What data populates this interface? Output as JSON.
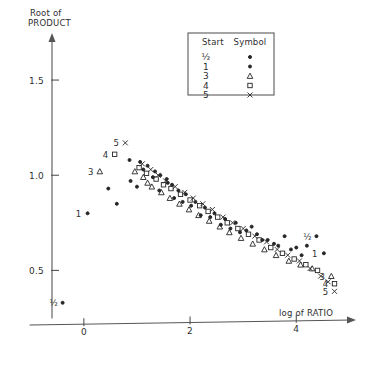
{
  "figure": {
    "title": "",
    "ylabel_line1": "Root of",
    "ylabel_line2": "PRODUCT",
    "xlabel": "log of RATIO"
  },
  "axes": {
    "x_ticks": [
      "0",
      "2",
      "4"
    ],
    "y_ticks": [
      "1.5",
      "1.0",
      "0.5"
    ],
    "x_tick_values": [
      0,
      2,
      4
    ],
    "y_tick_values": [
      1.5,
      1.0,
      0.5
    ]
  },
  "legend": {
    "header_left": "Start",
    "header_right": "Symbol",
    "rows": [
      {
        "label": "½",
        "symbol": "dot"
      },
      {
        "label": "1",
        "symbol": "dot"
      },
      {
        "label": "3",
        "symbol": "triangle"
      },
      {
        "label": "4",
        "symbol": "square"
      },
      {
        "label": "5",
        "symbol": "cross"
      }
    ]
  },
  "annotations": [
    {
      "text": "5",
      "x": 0.78,
      "y": 1.17,
      "symbol": "cross"
    },
    {
      "text": "4",
      "x": 0.58,
      "y": 1.11,
      "symbol": "square"
    },
    {
      "text": "3",
      "x": 0.3,
      "y": 1.02,
      "symbol": "triangle"
    },
    {
      "text": "1",
      "x": 0.07,
      "y": 0.8,
      "symbol": "dot"
    },
    {
      "text": "½",
      "x": -0.4,
      "y": 0.33,
      "symbol": "dot"
    },
    {
      "text": "½",
      "x": 4.38,
      "y": 0.68,
      "symbol": "dot"
    },
    {
      "text": "1",
      "x": 4.52,
      "y": 0.59,
      "symbol": "dot"
    },
    {
      "text": "3",
      "x": 4.66,
      "y": 0.47,
      "symbol": "triangle"
    },
    {
      "text": "4",
      "x": 4.72,
      "y": 0.43,
      "symbol": "square"
    },
    {
      "text": "5",
      "x": 4.72,
      "y": 0.39,
      "symbol": "cross"
    }
  ],
  "chart_data": {
    "type": "scatter",
    "title": "",
    "xlabel": "log of RATIO",
    "ylabel": "Root of PRODUCT",
    "xlim": [
      -0.6,
      5.2
    ],
    "ylim": [
      0.25,
      1.7
    ],
    "grid": false,
    "legend_position": "top-right-inset",
    "legend_title_left": "Start",
    "legend_title_right": "Symbol",
    "series": [
      {
        "name": "½",
        "symbol": "dot",
        "points": [
          [
            -0.4,
            0.33
          ],
          [
            0.07,
            0.8
          ],
          [
            0.46,
            0.93
          ],
          [
            0.62,
            0.85
          ],
          [
            0.88,
            0.97
          ],
          [
            1.0,
            0.94
          ],
          [
            1.12,
            1.03
          ],
          [
            1.3,
            0.99
          ],
          [
            1.42,
            0.92
          ],
          [
            1.58,
            0.96
          ],
          [
            1.7,
            0.88
          ],
          [
            1.86,
            0.86
          ],
          [
            2.02,
            0.84
          ],
          [
            2.2,
            0.79
          ],
          [
            2.38,
            0.78
          ],
          [
            2.58,
            0.74
          ],
          [
            2.76,
            0.72
          ],
          [
            2.94,
            0.7
          ],
          [
            3.16,
            0.73
          ],
          [
            3.36,
            0.66
          ],
          [
            3.58,
            0.64
          ],
          [
            3.78,
            0.68
          ],
          [
            4.0,
            0.62
          ],
          [
            4.2,
            0.63
          ],
          [
            4.38,
            0.68
          ],
          [
            4.52,
            0.59
          ]
        ]
      },
      {
        "name": "1",
        "symbol": "dot",
        "points": [
          [
            0.86,
            1.08
          ],
          [
            1.06,
            1.07
          ],
          [
            1.2,
            1.05
          ],
          [
            1.34,
            1.02
          ],
          [
            1.44,
            1.0
          ],
          [
            1.56,
            0.98
          ],
          [
            1.66,
            0.95
          ],
          [
            1.78,
            0.92
          ],
          [
            1.92,
            0.9
          ],
          [
            2.1,
            0.86
          ],
          [
            2.28,
            0.83
          ],
          [
            2.46,
            0.8
          ],
          [
            2.66,
            0.77
          ],
          [
            2.86,
            0.75
          ],
          [
            3.06,
            0.71
          ],
          [
            3.26,
            0.69
          ],
          [
            3.46,
            0.66
          ],
          [
            3.66,
            0.63
          ],
          [
            3.9,
            0.61
          ],
          [
            4.1,
            0.58
          ]
        ]
      },
      {
        "name": "3",
        "symbol": "triangle",
        "points": [
          [
            0.3,
            1.02
          ],
          [
            0.96,
            1.02
          ],
          [
            1.12,
            0.99
          ],
          [
            1.2,
            0.96
          ],
          [
            1.28,
            0.94
          ],
          [
            1.46,
            0.91
          ],
          [
            1.62,
            0.88
          ],
          [
            1.8,
            0.85
          ],
          [
            1.98,
            0.82
          ],
          [
            2.16,
            0.79
          ],
          [
            2.36,
            0.76
          ],
          [
            2.56,
            0.73
          ],
          [
            2.74,
            0.7
          ],
          [
            2.96,
            0.67
          ],
          [
            3.18,
            0.64
          ],
          [
            3.4,
            0.61
          ],
          [
            3.62,
            0.58
          ],
          [
            3.86,
            0.55
          ],
          [
            4.08,
            0.53
          ],
          [
            4.3,
            0.51
          ],
          [
            4.66,
            0.47
          ]
        ]
      },
      {
        "name": "4",
        "symbol": "square",
        "points": [
          [
            0.58,
            1.11
          ],
          [
            1.04,
            1.04
          ],
          [
            1.18,
            1.01
          ],
          [
            1.36,
            0.98
          ],
          [
            1.5,
            0.95
          ],
          [
            1.64,
            0.93
          ],
          [
            1.82,
            0.9
          ],
          [
            2.0,
            0.87
          ],
          [
            2.18,
            0.84
          ],
          [
            2.34,
            0.81
          ],
          [
            2.52,
            0.78
          ],
          [
            2.7,
            0.75
          ],
          [
            2.9,
            0.72
          ],
          [
            3.1,
            0.69
          ],
          [
            3.3,
            0.66
          ],
          [
            3.52,
            0.62
          ],
          [
            3.74,
            0.59
          ],
          [
            3.96,
            0.56
          ],
          [
            4.18,
            0.53
          ],
          [
            4.4,
            0.5
          ],
          [
            4.72,
            0.43
          ]
        ]
      },
      {
        "name": "5",
        "symbol": "cross",
        "points": [
          [
            0.78,
            1.17
          ],
          [
            1.1,
            1.06
          ],
          [
            1.26,
            1.03
          ],
          [
            1.4,
            1.0
          ],
          [
            1.54,
            0.97
          ],
          [
            1.72,
            0.94
          ],
          [
            1.9,
            0.91
          ],
          [
            2.06,
            0.88
          ],
          [
            2.24,
            0.85
          ],
          [
            2.42,
            0.82
          ],
          [
            2.62,
            0.78
          ],
          [
            2.8,
            0.75
          ],
          [
            3.0,
            0.72
          ],
          [
            3.22,
            0.68
          ],
          [
            3.44,
            0.65
          ],
          [
            3.64,
            0.61
          ],
          [
            3.84,
            0.58
          ],
          [
            4.06,
            0.55
          ],
          [
            4.26,
            0.51
          ],
          [
            4.46,
            0.47
          ],
          [
            4.6,
            0.44
          ],
          [
            4.72,
            0.39
          ]
        ]
      }
    ]
  }
}
